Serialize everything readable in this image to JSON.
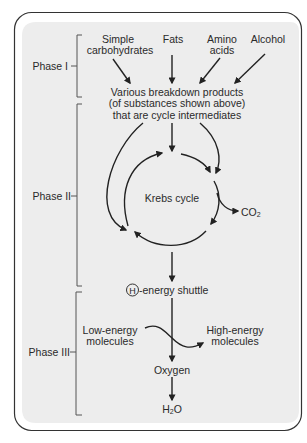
{
  "phases": [
    {
      "label": "Phase I"
    },
    {
      "label": "Phase II"
    },
    {
      "label": "Phase III"
    }
  ],
  "phase1": {
    "sources": [
      {
        "line1": "Simple",
        "line2": "carbohydrates"
      },
      {
        "line1": "Fats",
        "line2": ""
      },
      {
        "line1": "Amino",
        "line2": "acids"
      },
      {
        "line1": "Alcohol",
        "line2": ""
      }
    ],
    "products": {
      "line1": "Various breakdown products",
      "line2": "(of substances shown  above)",
      "line3": "that are cycle intermediates"
    }
  },
  "phase2": {
    "cycle_label": "Krebs cycle",
    "byproduct": "CO",
    "byproduct_sub": "2"
  },
  "phase3": {
    "shuttle_symbol": "H",
    "shuttle_label": "-energy shuttle",
    "low_energy": {
      "line1": "Low-energy",
      "line2": "molecules"
    },
    "high_energy": {
      "line1": "High-energy",
      "line2": "molecules"
    },
    "acceptor": "Oxygen",
    "product": "H",
    "product_sub": "2",
    "product_tail": "O"
  },
  "colors": {
    "panel_fill": "#ededed",
    "border": "#333333",
    "ink": "#2a2a2a",
    "bracket": "#555555"
  }
}
